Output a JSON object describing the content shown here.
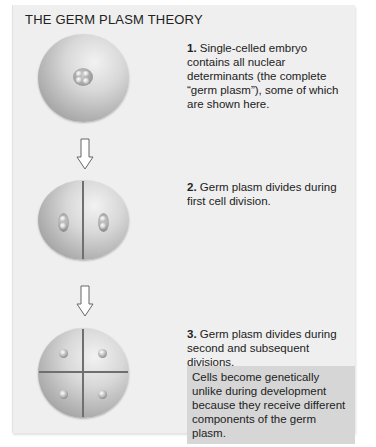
{
  "title": "THE GERM PLASM THEORY",
  "steps": [
    {
      "number": "1.",
      "text": "Single-celled embryo contains all nuclear determinants (the complete “germ plasm”), some of which are shown here.",
      "illustration": "single-cell-embryo"
    },
    {
      "number": "2.",
      "text": "Germ plasm divides during first cell division.",
      "illustration": "two-cell-embryo"
    },
    {
      "number": "3.",
      "text": "Germ plasm divides during second and subsequent divisions.",
      "illustration": "four-cell-embryo"
    }
  ],
  "note": "Cells become genetically unlike during development because they receive different components of the germ plasm.",
  "arrows": [
    "down-arrow-icon",
    "down-arrow-icon"
  ],
  "colors": {
    "panel_bg": "#efefef",
    "note_bg": "#d6d6d6",
    "text": "#222222"
  }
}
